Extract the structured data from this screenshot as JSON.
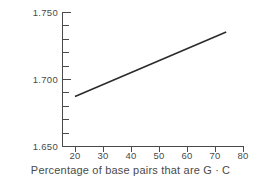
{
  "chart_data": {
    "type": "line",
    "title": "",
    "subtitle": "",
    "xlabel_prefix": "Percentage of base pairs that are G",
    "xlabel_separator": "·",
    "xlabel_suffix": "C",
    "xlabel": "Percentage of base pairs that are G · C",
    "ylabel": "ρ(g/cm³)",
    "ylabel_symbol": "ρ",
    "ylabel_units": "(g/cm",
    "ylabel_exponent": "3",
    "ylabel_close": ")",
    "xlim": [
      15,
      80
    ],
    "ylim": [
      1.65,
      1.75
    ],
    "grid": false,
    "legend": false,
    "legend_position": "none",
    "x_ticks_major": [
      20,
      30,
      40,
      50,
      60,
      70,
      80
    ],
    "x_tick_labels": [
      "20",
      "30",
      "40",
      "50",
      "60",
      "70",
      "80"
    ],
    "y_ticks_major": [
      1.65,
      1.7,
      1.75
    ],
    "y_tick_labels": [
      "1.650",
      "1.700",
      "1.750"
    ],
    "y_ticks_minor": [
      1.66,
      1.67,
      1.68,
      1.69,
      1.71,
      1.72,
      1.73,
      1.74
    ],
    "line_color": "#2b2b2b",
    "axis_color": "#4a4a4a",
    "series": [
      {
        "name": "density vs G·C content",
        "x": [
          20,
          74
        ],
        "y": [
          1.687,
          1.735
        ]
      }
    ]
  }
}
